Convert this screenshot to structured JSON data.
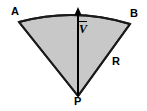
{
  "figure": {
    "type": "geometry-diagram",
    "background_color": "#ffffff",
    "fill_color": "#c8c8c8",
    "stroke_color": "#1a1a1a",
    "labels": {
      "vertex_left": "A",
      "vertex_right": "B",
      "vertex_apex": "P",
      "radius": "R",
      "vector": "V"
    },
    "geometry": {
      "apex": {
        "x": 78,
        "y": 96
      },
      "arc_start": {
        "x": 19,
        "y": 22
      },
      "arc_end": {
        "x": 130,
        "y": 24
      },
      "arc_apex": {
        "x": 75,
        "y": 11
      },
      "vector_tail": {
        "x": 78,
        "y": 96
      },
      "vector_head": {
        "x": 78,
        "y": 9
      }
    }
  }
}
